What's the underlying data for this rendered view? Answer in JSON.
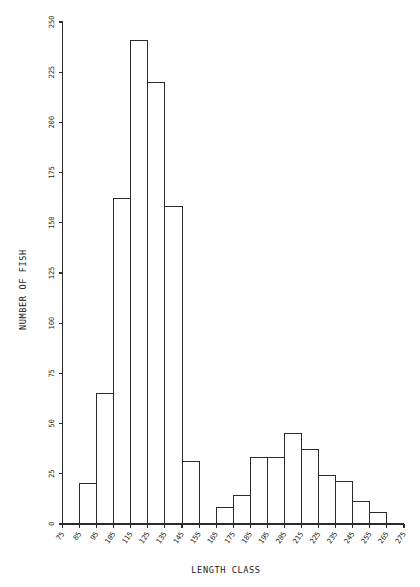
{
  "chart_data": {
    "type": "bar",
    "title": "",
    "xlabel": "LENGTH CLASS",
    "ylabel": "NUMBER OF FISH",
    "xlim": [
      75,
      275
    ],
    "ylim": [
      0,
      250
    ],
    "bin_width": 10,
    "grid": false,
    "legend": null,
    "xtick_labels": [
      "75",
      "85",
      "95",
      "105",
      "115",
      "125",
      "135",
      "145",
      "155",
      "165",
      "175",
      "185",
      "195",
      "205",
      "215",
      "225",
      "235",
      "245",
      "255",
      "265",
      "275"
    ],
    "ytick_labels": [
      "0",
      "25",
      "50",
      "75",
      "100",
      "125",
      "150",
      "175",
      "200",
      "225",
      "250"
    ],
    "ytick_values": [
      0,
      25,
      50,
      75,
      100,
      125,
      150,
      175,
      200,
      225,
      250
    ],
    "categories": [
      "75-85",
      "85-95",
      "95-105",
      "105-115",
      "115-125",
      "125-135",
      "135-145",
      "145-155",
      "155-165",
      "165-175",
      "175-185",
      "185-195",
      "195-205",
      "205-215",
      "215-225",
      "225-235",
      "235-245",
      "245-255",
      "255-265",
      "265-275"
    ],
    "bin_starts": [
      75,
      85,
      95,
      105,
      115,
      125,
      135,
      145,
      155,
      165,
      175,
      185,
      195,
      205,
      215,
      225,
      235,
      245,
      255,
      265
    ],
    "values": [
      0,
      20,
      65,
      162,
      241,
      220,
      158,
      31,
      0,
      8,
      14,
      33,
      33,
      45,
      37,
      24,
      21,
      11,
      6,
      0
    ],
    "colors": {
      "bar_stroke": "#2b2b2b",
      "bar_fill": "none",
      "axis": "#2b2b2b",
      "text": "#1a1a1a",
      "background": "#ffffff"
    }
  }
}
